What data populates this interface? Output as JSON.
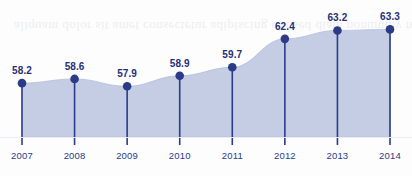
{
  "chart_data": {
    "type": "area",
    "title": "",
    "subtitle": "",
    "xlabel": "",
    "ylabel": "",
    "categories": [
      "2007",
      "2008",
      "2009",
      "2010",
      "2011",
      "2012",
      "2013",
      "2014"
    ],
    "values": [
      58.2,
      58.6,
      57.9,
      58.9,
      59.7,
      62.4,
      63.2,
      63.3
    ],
    "value_labels": [
      "58.2",
      "58.6",
      "57.9",
      "58.9",
      "59.7",
      "62.4",
      "63.2",
      "63.3"
    ],
    "series": [
      {
        "name": "",
        "values": [
          58.2,
          58.6,
          57.9,
          58.9,
          59.7,
          62.4,
          63.2,
          63.3
        ]
      }
    ],
    "ylim": [
      56.6,
      64.0
    ],
    "xlim": [
      2007,
      2014
    ],
    "grid": false,
    "legend": false,
    "legend_position": "none",
    "markers": "filled-circle-with-stem",
    "annotations": []
  },
  "style": {
    "area_fill": "#c4cde3",
    "area_edge": "#b3bedb",
    "marker_color": "#2b3b87",
    "stem_color": "#2b3b87",
    "value_label_color": "#1f2f78",
    "tick_label_color": "#2b3b87",
    "background": "#fdfdfd"
  },
  "artifacts": {
    "bleed_through_text": "aliquam dolor sit amet consectetur adipiscing elit sed diam nonummy nibh euismod tincidunt ut laoreet dolore magna aliquam erat volutpat ut wisi enim ad minim veniam quis nostrud exerci tation ullamcorper suscipit lobortis nisl ut aliquip ex ea commodo consequat duis autem vel eum iriure"
  }
}
